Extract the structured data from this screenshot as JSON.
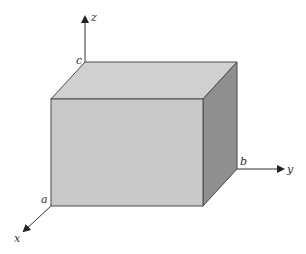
{
  "diagram": {
    "type": "rectangular box in 3D coordinate axes",
    "axes": {
      "x": {
        "label": "x"
      },
      "y": {
        "label": "y"
      },
      "z": {
        "label": "z"
      }
    },
    "vertex_labels": {
      "a": "a",
      "b": "b",
      "c": "c"
    },
    "colors": {
      "front_face": "#c9c9c9",
      "top_face": "#d0d0d0",
      "side_face": "#8f8f8f",
      "edge": "#4a4a4a",
      "axis": "#333333"
    }
  }
}
